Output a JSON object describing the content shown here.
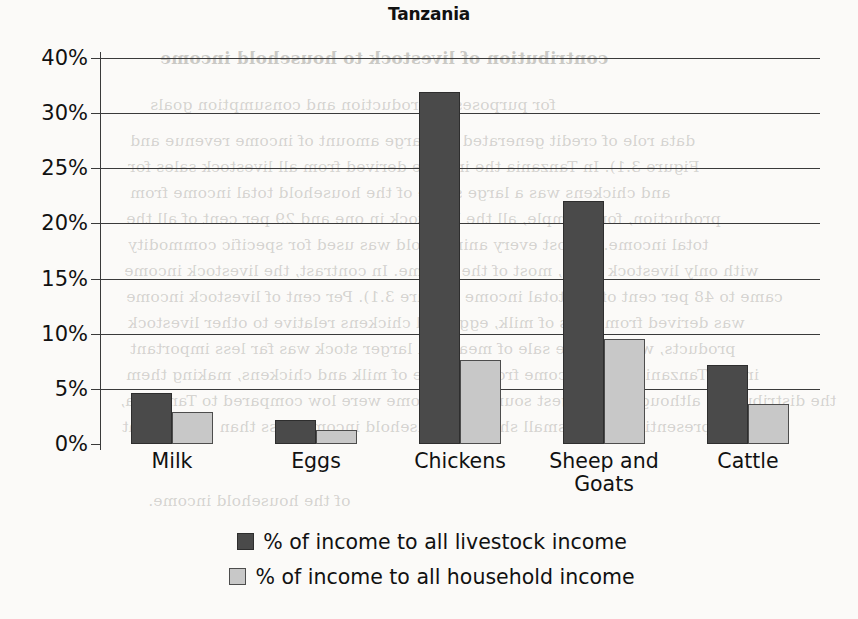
{
  "chart_data": {
    "type": "bar",
    "title": "Tanzania",
    "xlabel": "",
    "ylabel": "",
    "categories": [
      "Milk",
      "Eggs",
      "Chickens",
      "Sheep and Goats",
      "Cattle"
    ],
    "series": [
      {
        "name": "% of income to all livestock income",
        "color": "#4a4a4a",
        "values": [
          4.6,
          2.2,
          33.8,
          22.0,
          7.2
        ]
      },
      {
        "name": "% of income to all household income",
        "color": "#c8c8c8",
        "values": [
          2.9,
          1.3,
          7.6,
          9.5,
          3.6
        ]
      }
    ],
    "y_ticks": [
      "0%",
      "5%",
      "10%",
      "15%",
      "20%",
      "25%",
      "30%",
      "40%"
    ],
    "y_tick_values": [
      0,
      5,
      10,
      15,
      20,
      25,
      30,
      40
    ],
    "y_axis_scale": "categorical-equal-spacing",
    "ylim": [
      0,
      40
    ],
    "grid": "horizontal",
    "legend_position": "bottom"
  },
  "legend": {
    "items": [
      {
        "label": "% of income to all livestock income",
        "swatch": "dark"
      },
      {
        "label": "% of income to all household income",
        "swatch": "light"
      }
    ]
  },
  "background_text": {
    "heading": "contribution of livestock to household income",
    "lines": [
      "for purposes of production and consumption goals",
      "data role of credit generated the large amount of income revenue and",
      "Figure 3.1). In Tanzania the income derived from all livestock sales for",
      "and chickens was a large share of the household total income from",
      "production, for example, all the livestock in one and 29 per cent of all the",
      "total income. Almost every animal sold was used for specific commodity",
      "with only livestock sales, most of the income. In contrast, the livestock income",
      "came to 48 per cent of the total income (Figure 3.1). Per cent of livestock income",
      "was derived from sales of milk, eggs and chickens relative to other livestock",
      "products, whereas the sale of meat and larger stock was far less important",
      "in the Tanzania sites. Income from the sale of milk and chickens, making them",
      "the distribution, although the largest sources of income were low compared to Tanzania,",
      "often representing only a small share of household income, less than 10 per cent",
      "of the household income."
    ]
  }
}
